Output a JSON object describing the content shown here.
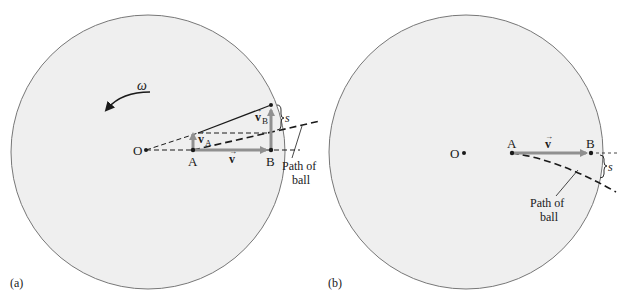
{
  "panels": [
    {
      "id": "a",
      "caption": "(a)",
      "labels": {
        "omega": "ω",
        "O": "O",
        "A": "A",
        "B": "B",
        "v": "v",
        "vA": "v",
        "vA_sub": "A",
        "vB": "v",
        "vB_sub": "B",
        "s": "s",
        "path_line1": "Path of",
        "path_line2": "ball"
      }
    },
    {
      "id": "b",
      "caption": "(b)",
      "labels": {
        "O": "O",
        "A": "A",
        "B": "B",
        "v": "v",
        "s": "s",
        "path_line1": "Path of",
        "path_line2": "ball"
      }
    }
  ],
  "colors": {
    "disk_fill": "#efefef",
    "disk_stroke": "#777777",
    "vector_gray": "#909090",
    "line": "#1a1a1a"
  }
}
